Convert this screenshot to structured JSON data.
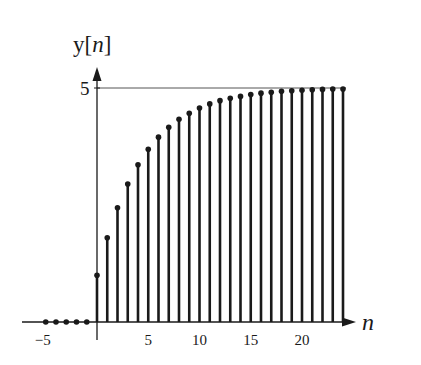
{
  "chart_data": {
    "type": "stem",
    "title": "",
    "xlabel": "n",
    "ylabel": "y[n]",
    "x": [
      -5,
      -4,
      -3,
      -2,
      -1,
      0,
      1,
      2,
      3,
      4,
      5,
      6,
      7,
      8,
      9,
      10,
      11,
      12,
      13,
      14,
      15,
      16,
      17,
      18,
      19,
      20,
      21,
      22,
      23,
      24
    ],
    "values": [
      0,
      0,
      0,
      0,
      0,
      1.0,
      1.8,
      2.44,
      2.95,
      3.36,
      3.69,
      3.95,
      4.16,
      4.33,
      4.46,
      4.57,
      4.66,
      4.73,
      4.78,
      4.82,
      4.86,
      4.89,
      4.91,
      4.93,
      4.94,
      4.95,
      4.96,
      4.97,
      4.98,
      4.98
    ],
    "reference_line": {
      "y": 5
    },
    "xticks": [
      -5,
      5,
      10,
      15,
      20
    ],
    "xtick_labels": [
      "−5",
      "5",
      "10",
      "15",
      "20"
    ],
    "yticks": [
      5
    ],
    "ytick_labels": [
      "5"
    ],
    "xlim": [
      -7,
      29
    ],
    "ylim": [
      0,
      5.4
    ],
    "grid": false,
    "legend": null
  },
  "labels": {
    "y_axis": "y[n]",
    "x_axis": "n"
  },
  "colors": {
    "ink": "#1a1a1a",
    "background": "#ffffff"
  }
}
